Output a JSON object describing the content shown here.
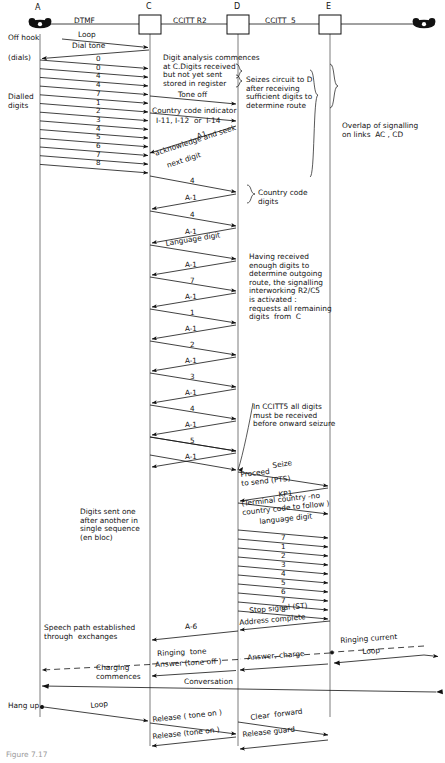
{
  "figure": {
    "caption": "Figure 7.17"
  },
  "exchanges": [
    {
      "id": "A",
      "label": "A",
      "kind": "telephone",
      "x": 40
    },
    {
      "id": "C",
      "label": "C",
      "kind": "exchange-box",
      "x": 150
    },
    {
      "id": "D",
      "label": "D",
      "kind": "exchange-box",
      "x": 238
    },
    {
      "id": "E",
      "label": "E",
      "kind": "exchange-box",
      "x": 330
    },
    {
      "id": "B",
      "label": "",
      "kind": "telephone",
      "x": 424
    }
  ],
  "links": [
    {
      "label": "DTMF",
      "between": "A-C"
    },
    {
      "label": "CCITT R2",
      "between": "C-D"
    },
    {
      "label": "CCITT  5",
      "between": "D-E"
    }
  ],
  "left_annotations": [
    {
      "text": "Off hook",
      "y": 38
    },
    {
      "text": "(dials)",
      "y": 58
    },
    {
      "text": "Dialled\ndigits",
      "y": 97
    }
  ],
  "right_annotations": [
    {
      "text": "Digit analysis commences\nat C.Digits received\nbut not yet sent\nstored in register",
      "y": 57
    },
    {
      "text": "Seizes circuit to D\nafter receiving\nsufficient digits to\ndetermine route",
      "y": 79
    },
    {
      "text": "Overlap of signalling\non links  AC , CD",
      "y": 128
    },
    {
      "text": "Country code\ndigits",
      "y": 200
    },
    {
      "text": "Having received\nenough digits to\ndetermine outgoing\nroute, the signalling\ninterworking R2/C5\nis activated :\nrequests all remaining\ndigits  from  C",
      "y": 245
    },
    {
      "text": "In CCITT5 all digits\nmust be received\nbefore onward seizure",
      "y": 409
    },
    {
      "text": "Digits sent one\nafter another in\nsingle sequence\n(en bloc)",
      "y": 512
    },
    {
      "text": "Speech path established\nthrough  exchanges",
      "y": 628
    },
    {
      "text": "Charging\ncommences",
      "y": 670
    },
    {
      "text": "Hang up",
      "y": 706
    }
  ],
  "signal_labels": {
    "loop": "Loop",
    "dial_tone": "Dial tone",
    "tone_off": "Tone off",
    "country_code_indicator": "Country code indicator",
    "country_code_values": "I-11, I-12  or  I-14",
    "a1": "A1",
    "ack_seek": "acknowledge and seek",
    "next_digit": "next digit",
    "language_digit": "Language digit",
    "seize": "Seize",
    "proceed_to_send": "Proceed\nto send (PTS)",
    "kp1": "KP1",
    "terminal_country": "(Terminal country -no\ncountry code to follow )",
    "language_digit2": "language digit",
    "stop_signal": "Stop signal (ST)",
    "address_complete": "Address complete",
    "a6": "A-6",
    "ringing_tone": "Ringing  tone",
    "ringing_current": "Ringing current",
    "loop2": "Loop",
    "answer_tone_off": "Answer (tone off )",
    "answer_charge": "Answer, charge",
    "conversation": "Conversation",
    "loop3": "Loop",
    "release_tone_on": "Release ( tone on )",
    "clear_forward": "Clear  forward",
    "release_tone_on2": "Release (tone on )",
    "release_guard": "Release guard"
  },
  "dialled_digits": [
    "0",
    "0",
    "4",
    "4",
    "7",
    "1",
    "2",
    "3",
    "4",
    "5",
    "6",
    "7",
    "8"
  ],
  "ac_ack_digits": [
    "4",
    "A-1",
    "4",
    "A-1"
  ],
  "r2_exchange": [
    {
      "fwd": "A-1",
      "back": "7"
    },
    {
      "fwd": "A-1",
      "back": "1"
    },
    {
      "fwd": "A-1",
      "back": "2"
    },
    {
      "fwd": "A-1",
      "back": "3"
    },
    {
      "fwd": "A-1",
      "back": "4"
    },
    {
      "fwd": "A-1",
      "back": "5"
    },
    {
      "fwd": "A-1",
      "back": "6"
    },
    {
      "fwd": "A-1",
      "back": "7"
    },
    {
      "fwd": "A-1",
      "back": "8"
    }
  ],
  "c5_digits": [
    "7",
    "1",
    "2",
    "3",
    "4",
    "5",
    "6",
    "7",
    "8"
  ]
}
